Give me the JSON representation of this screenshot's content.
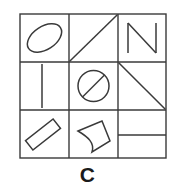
{
  "figure": {
    "label": "C",
    "type": "3x3-matrix-panel",
    "stroke_color": "#3a3a3a",
    "background_color": "#ffffff",
    "grid": {
      "x": 20,
      "y": 14,
      "width": 146,
      "height": 144,
      "columns": 3,
      "rows": 3,
      "col_edges": [
        20,
        69,
        118,
        166
      ],
      "row_edges": [
        14,
        62,
        110,
        158
      ]
    },
    "cells": [
      {
        "row": 0,
        "col": 0,
        "name": "tilted-ellipse",
        "description": "Tilted outlined ellipse rotated about -35 degrees"
      },
      {
        "row": 0,
        "col": 1,
        "name": "diagonal-line-up",
        "description": "Diagonal line from bottom-left corner to top-right corner"
      },
      {
        "row": 0,
        "col": 2,
        "name": "letter-n-shape",
        "description": "Letter N outline: left vertical, diagonal, right vertical"
      },
      {
        "row": 1,
        "col": 0,
        "name": "vertical-line",
        "description": "Single vertical line left of center"
      },
      {
        "row": 1,
        "col": 1,
        "name": "circle-with-slash",
        "description": "Circle outline with a diagonal slash through it"
      },
      {
        "row": 1,
        "col": 2,
        "name": "diagonal-line-down",
        "description": "Diagonal line from top-left corner to bottom-right corner"
      },
      {
        "row": 2,
        "col": 0,
        "name": "tilted-rectangle",
        "description": "Narrow tilted rectangle rotated about -40 degrees"
      },
      {
        "row": 2,
        "col": 1,
        "name": "curved-quadrilateral",
        "description": "Quadrilateral with concave curved left and bottom sides"
      },
      {
        "row": 2,
        "col": 2,
        "name": "horizontal-line",
        "description": "Single horizontal line across the middle of the cell"
      }
    ]
  }
}
